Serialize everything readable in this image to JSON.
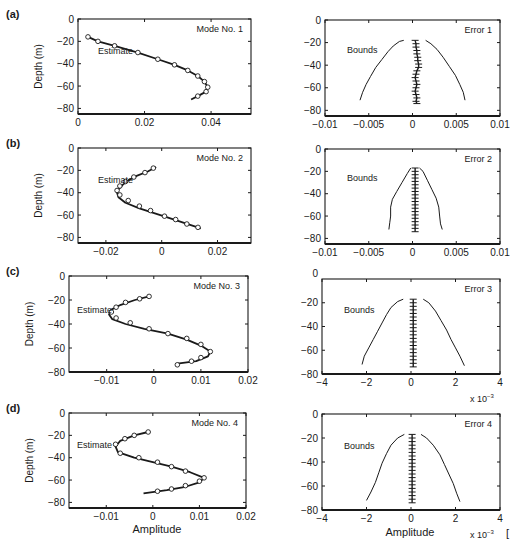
{
  "figure": {
    "width": 518,
    "height": 550,
    "ink_color": "#1a1a1a",
    "background": "#ffffff",
    "bottom_xlabel_left": "Amplitude",
    "bottom_xlabel_right": "Amplitude",
    "trailing_mark": "["
  },
  "chart_data": [
    {
      "id": "a-mode",
      "panel_label": "(a)",
      "type": "line",
      "title": "Mode No. 1",
      "annotation": "Estimate",
      "xlabel": "",
      "ylabel": "Depth (m)",
      "xlim": [
        0,
        0.052
      ],
      "ylim": [
        -85,
        0
      ],
      "xticks": [
        0,
        0.02,
        0.04
      ],
      "xtick_labels": [
        "0",
        "0.02",
        "0.04"
      ],
      "yticks": [
        0,
        -20,
        -40,
        -60,
        -80
      ],
      "ytick_labels": [
        "0",
        "-20",
        "-40",
        "-60",
        "-80"
      ],
      "frame": {
        "x": 78,
        "y": 19,
        "w": 173,
        "h": 95
      },
      "series": [
        {
          "name": "Estimate",
          "style": "line",
          "x": [
            0.003,
            0.006,
            0.011,
            0.018,
            0.024,
            0.029,
            0.033,
            0.036,
            0.038,
            0.039,
            0.0385,
            0.036,
            0.034
          ],
          "y": [
            -16,
            -20,
            -24,
            -30,
            -36,
            -41,
            -46,
            -51,
            -56,
            -61,
            -65,
            -69,
            -72
          ]
        },
        {
          "name": "True",
          "style": "circles",
          "x": [
            0.003,
            0.006,
            0.011,
            0.018,
            0.024,
            0.029,
            0.033,
            0.036,
            0.038,
            0.039,
            0.0385,
            0.036
          ],
          "y": [
            -16,
            -20,
            -24,
            -30,
            -36,
            -41,
            -46,
            -51,
            -56,
            -61,
            -65,
            -69
          ]
        }
      ]
    },
    {
      "id": "a-error",
      "type": "line",
      "title": "Error 1",
      "annotation": "Bounds",
      "xlabel": "",
      "ylabel": "",
      "xlim": [
        -0.01,
        0.01
      ],
      "ylim": [
        -85,
        0
      ],
      "xticks": [
        -0.01,
        -0.005,
        0,
        0.005,
        0.01
      ],
      "xtick_labels": [
        "-0.01",
        "-0.005",
        "0",
        "0.005",
        "0.01"
      ],
      "yticks": [
        0,
        -20,
        -40,
        -60,
        -80
      ],
      "ytick_labels": [
        "0",
        "-20",
        "-40",
        "-60",
        "-80"
      ],
      "frame": {
        "x": 325,
        "y": 20,
        "w": 175,
        "h": 96
      },
      "series": [
        {
          "name": "Lower bound",
          "style": "line",
          "x": [
            -0.001,
            -0.0015,
            -0.0022,
            -0.0028,
            -0.0035,
            -0.0042,
            -0.0048,
            -0.0053,
            -0.0057,
            -0.006
          ],
          "y": [
            -18,
            -19,
            -23,
            -28,
            -35,
            -42,
            -50,
            -57,
            -64,
            -71
          ]
        },
        {
          "name": "Upper bound",
          "style": "line",
          "x": [
            0.0015,
            0.0021,
            0.0028,
            0.0035,
            0.0042,
            0.0049,
            0.0054,
            0.0058,
            0.006
          ],
          "y": [
            -18,
            -21,
            -26,
            -33,
            -41,
            -49,
            -57,
            -64,
            -71
          ]
        },
        {
          "name": "Error",
          "style": "crosses",
          "x": [
            0.0003,
            0.0004,
            0.0004,
            0.0005,
            0.0005,
            0.0006,
            0.0006,
            0.0007,
            0.0007,
            0.0005,
            0.0004,
            0.0003,
            0.0004,
            0.0005,
            0.0004,
            0.0003,
            0.0004,
            0.0005,
            0.0004,
            0.0005
          ],
          "y": [
            -18,
            -21,
            -24,
            -27,
            -30,
            -33,
            -36,
            -39,
            -42,
            -45,
            -48,
            -51,
            -54,
            -57,
            -60,
            -63,
            -66,
            -69,
            -72,
            -74
          ]
        }
      ]
    },
    {
      "id": "b-mode",
      "panel_label": "(b)",
      "type": "line",
      "title": "Mode No. 2",
      "annotation": "Estimate",
      "xlabel": "",
      "ylabel": "Depth (m)",
      "xlim": [
        -0.03,
        0.032
      ],
      "ylim": [
        -85,
        0
      ],
      "xticks": [
        -0.02,
        0,
        0.02
      ],
      "xtick_labels": [
        "-0.02",
        "0",
        "0.02"
      ],
      "yticks": [
        0,
        -20,
        -40,
        -60,
        -80
      ],
      "ytick_labels": [
        "0",
        "-20",
        "-40",
        "-60",
        "-80"
      ],
      "frame": {
        "x": 78,
        "y": 148,
        "w": 173,
        "h": 95
      },
      "series": [
        {
          "name": "Estimate",
          "style": "line",
          "x": [
            -0.002,
            -0.005,
            -0.009,
            -0.012,
            -0.014,
            -0.0155,
            -0.016,
            -0.0155,
            -0.013,
            -0.008,
            -0.003,
            0.002,
            0.008,
            0.014
          ],
          "y": [
            -17,
            -21,
            -25,
            -29,
            -33,
            -37,
            -40,
            -44,
            -49,
            -54,
            -58,
            -62,
            -67,
            -72
          ]
        },
        {
          "name": "True",
          "style": "circles",
          "x": [
            -0.003,
            -0.006,
            -0.01,
            -0.013,
            -0.015,
            -0.016,
            -0.015,
            -0.012,
            -0.008,
            -0.004,
            0.001,
            0.005,
            0.009,
            0.013
          ],
          "y": [
            -18,
            -22,
            -26,
            -30,
            -34,
            -38,
            -42,
            -47,
            -52,
            -56,
            -61,
            -64,
            -68,
            -71
          ]
        }
      ]
    },
    {
      "id": "b-error",
      "type": "line",
      "title": "Error 2",
      "annotation": "Bounds",
      "xlabel": "",
      "ylabel": "",
      "xlim": [
        -0.01,
        0.01
      ],
      "ylim": [
        -85,
        0
      ],
      "xticks": [
        -0.01,
        -0.005,
        0,
        0.005,
        0.01
      ],
      "xtick_labels": [
        "-0.01",
        "-0.005",
        "0",
        "0.005",
        "0.01"
      ],
      "yticks": [
        0,
        -20,
        -40,
        -60,
        -80
      ],
      "ytick_labels": [
        "0",
        "-20",
        "-40",
        "-60",
        "-80"
      ],
      "frame": {
        "x": 325,
        "y": 149,
        "w": 175,
        "h": 95
      },
      "series": [
        {
          "name": "Lower bound",
          "style": "line",
          "x": [
            -0.0002,
            -0.0006,
            -0.0012,
            -0.0018,
            -0.0023,
            -0.0025,
            -0.0025,
            -0.0026,
            -0.0027
          ],
          "y": [
            -17,
            -22,
            -30,
            -38,
            -45,
            -52,
            -60,
            -66,
            -72
          ]
        },
        {
          "name": "Upper bound",
          "style": "line",
          "x": [
            0.0008,
            0.0012,
            0.0017,
            0.0022,
            0.0027,
            0.003,
            0.0031,
            0.0032,
            0.0034
          ],
          "y": [
            -17,
            -20,
            -28,
            -36,
            -44,
            -52,
            -60,
            -67,
            -72
          ]
        },
        {
          "name": "Error",
          "style": "crosses",
          "x": [
            0.0003,
            0.0003,
            0.0003,
            0.0003,
            0.0003,
            0.0003,
            0.0003,
            0.0003,
            0.0003,
            0.0003,
            0.0003,
            0.0003,
            0.0003,
            0.0003,
            0.0003,
            0.0003,
            0.0003,
            0.0003,
            0.0003,
            0.0003
          ],
          "y": [
            -17,
            -20,
            -23,
            -26,
            -29,
            -32,
            -35,
            -38,
            -41,
            -44,
            -47,
            -50,
            -53,
            -56,
            -59,
            -62,
            -65,
            -68,
            -71,
            -74
          ]
        }
      ]
    },
    {
      "id": "c-mode",
      "panel_label": "(c)",
      "type": "line",
      "title": "Mode No. 3",
      "annotation": "Estimate",
      "xlabel": "",
      "ylabel": "Depth (m)",
      "xlim": [
        -0.018,
        0.02
      ],
      "ylim": [
        -80,
        0
      ],
      "xticks": [
        -0.01,
        0,
        0.01,
        0.02
      ],
      "xtick_labels": [
        "-0.01",
        "0",
        "0.01",
        "0.02"
      ],
      "yticks": [
        0,
        -20,
        -40,
        -60,
        -80
      ],
      "ytick_labels": [
        "0",
        "-20",
        "-40",
        "-60",
        "-80"
      ],
      "frame": {
        "x": 69,
        "y": 276,
        "w": 179,
        "h": 96
      },
      "series": [
        {
          "name": "Estimate",
          "style": "line",
          "x": [
            -0.001,
            -0.004,
            -0.007,
            -0.009,
            -0.0095,
            -0.0088,
            -0.006,
            -0.002,
            0.003,
            0.007,
            0.01,
            0.012,
            0.0115,
            0.009,
            0.005
          ],
          "y": [
            -17,
            -20,
            -24,
            -28,
            -32,
            -36,
            -40,
            -44,
            -48,
            -53,
            -58,
            -63,
            -67,
            -71,
            -73
          ]
        },
        {
          "name": "True",
          "style": "circles",
          "x": [
            -0.001,
            -0.003,
            -0.006,
            -0.008,
            -0.009,
            -0.008,
            -0.005,
            -0.001,
            0.003,
            0.007,
            0.01,
            0.012,
            0.01,
            0.008,
            0.005
          ],
          "y": [
            -17,
            -19,
            -22,
            -26,
            -30,
            -35,
            -39,
            -44,
            -48,
            -52,
            -57,
            -63,
            -68,
            -71,
            -74
          ]
        }
      ]
    },
    {
      "id": "c-error",
      "type": "line",
      "title": "Error 3",
      "annotation": "Bounds",
      "xlabel": "",
      "ylabel": "",
      "xlim": [
        -4,
        4
      ],
      "ylim": [
        -80,
        0
      ],
      "x_multiplier_label": "x 10-3",
      "xticks": [
        -4,
        -2,
        0,
        2,
        4
      ],
      "xtick_labels": [
        "-4",
        "-2",
        "0",
        "2",
        "4"
      ],
      "yticks": [
        -20,
        -40,
        -60,
        -80
      ],
      "ytick_labels": [
        "-20",
        "-40",
        "-60",
        "-80"
      ],
      "top_tick_label": "0",
      "frame": {
        "x": 322,
        "y": 279,
        "w": 178,
        "h": 95
      },
      "series": [
        {
          "name": "Lower bound",
          "style": "line",
          "x": [
            -0.35,
            -0.6,
            -0.9,
            -1.1,
            -1.3,
            -1.5,
            -1.7,
            -1.9,
            -2.1,
            -2.2
          ],
          "y": [
            -17,
            -19,
            -24,
            -30,
            -37,
            -44,
            -51,
            -58,
            -65,
            -72
          ]
        },
        {
          "name": "Upper bound",
          "style": "line",
          "x": [
            0.55,
            0.8,
            1.1,
            1.35,
            1.6,
            1.8,
            2.0,
            2.2,
            2.4
          ],
          "y": [
            -17,
            -20,
            -27,
            -35,
            -43,
            -51,
            -58,
            -65,
            -73
          ]
        },
        {
          "name": "Error",
          "style": "crosses",
          "x": [
            0.1,
            0.1,
            0.1,
            0.1,
            0.1,
            0.1,
            0.1,
            0.1,
            0.1,
            0.1,
            0.1,
            0.1,
            0.1,
            0.1,
            0.1,
            0.1,
            0.1,
            0.1,
            0.1,
            0.1
          ],
          "y": [
            -17,
            -20,
            -23,
            -26,
            -29,
            -32,
            -35,
            -38,
            -41,
            -44,
            -47,
            -50,
            -53,
            -56,
            -59,
            -62,
            -65,
            -68,
            -71,
            -74
          ]
        }
      ]
    },
    {
      "id": "d-mode",
      "panel_label": "(d)",
      "type": "line",
      "title": "Mode No. 4",
      "annotation": "Estimate",
      "xlabel": "Amplitude",
      "ylabel": "Depth (m)",
      "xlim": [
        -0.018,
        0.02
      ],
      "ylim": [
        -85,
        0
      ],
      "xticks": [
        -0.01,
        0,
        0.01,
        0.02
      ],
      "xtick_labels": [
        "-0.01",
        "0",
        "0.01",
        "0.02"
      ],
      "yticks": [
        0,
        -20,
        -40,
        -60,
        -80
      ],
      "ytick_labels": [
        "0",
        "-20",
        "-40",
        "-60",
        "-80"
      ],
      "frame": {
        "x": 69,
        "y": 413,
        "w": 177,
        "h": 95
      },
      "series": [
        {
          "name": "Estimate",
          "style": "line",
          "x": [
            -0.001,
            -0.004,
            -0.007,
            -0.008,
            -0.0075,
            -0.004,
            0.0,
            0.004,
            0.008,
            0.011,
            0.01,
            0.007,
            0.003,
            -0.002
          ],
          "y": [
            -17,
            -20,
            -25,
            -30,
            -35,
            -40,
            -44,
            -48,
            -53,
            -58,
            -62,
            -66,
            -69,
            -72
          ]
        },
        {
          "name": "True",
          "style": "circles",
          "x": [
            -0.001,
            -0.004,
            -0.006,
            -0.008,
            -0.007,
            -0.003,
            0.001,
            0.004,
            0.007,
            0.011,
            0.01,
            0.007,
            0.004,
            0.001
          ],
          "y": [
            -17,
            -20,
            -23,
            -28,
            -36,
            -40,
            -44,
            -48,
            -52,
            -58,
            -61,
            -65,
            -68,
            -70
          ]
        }
      ]
    },
    {
      "id": "d-error",
      "type": "line",
      "title": "Error 4",
      "annotation": "Bounds",
      "xlabel": "Amplitude",
      "ylabel": "",
      "xlim": [
        -4,
        4
      ],
      "ylim": [
        -80,
        0
      ],
      "x_multiplier_label": "x 10-3",
      "xticks": [
        -4,
        -2,
        0,
        2,
        4
      ],
      "xtick_labels": [
        "-4",
        "-2",
        "0",
        "2",
        "4"
      ],
      "yticks": [
        0,
        -20,
        -40,
        -60,
        -80
      ],
      "ytick_labels": [
        "0",
        "-20",
        "-40",
        "-60",
        "-80"
      ],
      "frame": {
        "x": 322,
        "y": 414,
        "w": 178,
        "h": 96
      },
      "series": [
        {
          "name": "Lower bound",
          "style": "line",
          "x": [
            -0.3,
            -0.6,
            -0.9,
            -1.1,
            -1.3,
            -1.45,
            -1.6,
            -1.8,
            -2.0
          ],
          "y": [
            -17,
            -20,
            -26,
            -33,
            -41,
            -49,
            -57,
            -65,
            -72
          ]
        },
        {
          "name": "Upper bound",
          "style": "line",
          "x": [
            0.45,
            0.7,
            1.0,
            1.3,
            1.5,
            1.7,
            1.9,
            2.05,
            2.2
          ],
          "y": [
            -17,
            -20,
            -26,
            -34,
            -42,
            -50,
            -58,
            -66,
            -73
          ]
        },
        {
          "name": "Error",
          "style": "crosses",
          "x": [
            0.05,
            0.05,
            0.05,
            0.05,
            0.05,
            0.05,
            0.05,
            0.05,
            0.05,
            0.05,
            0.05,
            0.05,
            0.05,
            0.05,
            0.05,
            0.05,
            0.05,
            0.05,
            0.05,
            0.05
          ],
          "y": [
            -17,
            -20,
            -23,
            -26,
            -29,
            -32,
            -35,
            -38,
            -41,
            -44,
            -47,
            -50,
            -53,
            -56,
            -59,
            -62,
            -65,
            -68,
            -71,
            -74
          ]
        }
      ]
    }
  ]
}
